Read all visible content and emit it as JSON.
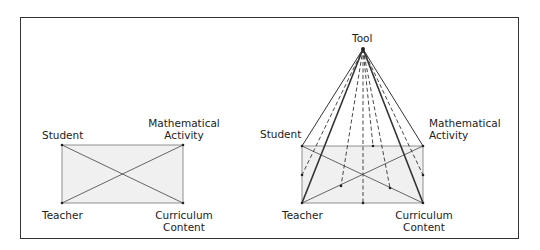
{
  "left_diagram": {
    "nodes": {
      "student": "Student",
      "math_activity_1": "Mathematical",
      "math_activity_2": "Activity",
      "teacher": "Teacher",
      "curriculum_1": "Curriculum",
      "curriculum_2": "Content"
    }
  },
  "right_diagram": {
    "apex": "Tool",
    "nodes": {
      "student": "Student",
      "math_activity_1": "Mathematical",
      "math_activity_2": "Activity",
      "teacher": "Teacher",
      "curriculum_1": "Curriculum",
      "curriculum_2": "Content"
    }
  },
  "colors": {
    "line": "#555555",
    "fill": "#f0f0f0",
    "bold_line": "#333333"
  }
}
